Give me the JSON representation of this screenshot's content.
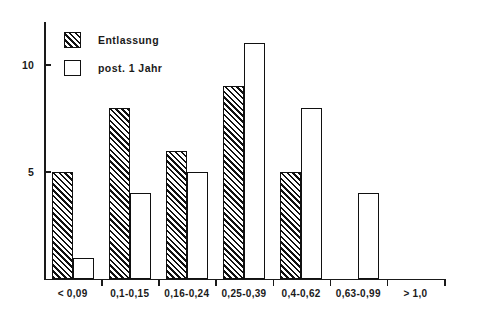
{
  "chart_data": {
    "type": "bar",
    "title": "",
    "subtitle": "",
    "xlabel": "",
    "ylabel": "",
    "grid": false,
    "legend_position": "top-left",
    "ylim": [
      0,
      12
    ],
    "yticks": [
      5,
      10
    ],
    "ytick_labels": [
      "5",
      "10"
    ],
    "categories": [
      "< 0,09",
      "0,1-0,15",
      "0,16-0,24",
      "0,25-0,39",
      "0,4-0,62",
      "0,63-0,99",
      "> 1,0"
    ],
    "series": [
      {
        "name": "Entlassung",
        "style": "hatched",
        "values": [
          5,
          8,
          6,
          9,
          5,
          0,
          0
        ]
      },
      {
        "name": "post. 1 Jahr",
        "style": "open",
        "values": [
          1,
          4,
          5,
          11,
          8,
          4,
          0
        ]
      }
    ]
  },
  "legend": {
    "items": [
      {
        "label": "Entlassung",
        "style": "hatched"
      },
      {
        "label": "post. 1 Jahr",
        "style": "open"
      }
    ]
  },
  "axes": {
    "y_tick_labels": [
      "10",
      "5"
    ],
    "x_tick_labels": [
      "< 0,09",
      "0,1-0,15",
      "0,16-0,24",
      "0,25-0,39",
      "0,4-0,62",
      "0,63-0,99",
      "> 1,0"
    ]
  },
  "colors": {
    "ink": "#111111",
    "background": "#ffffff"
  }
}
